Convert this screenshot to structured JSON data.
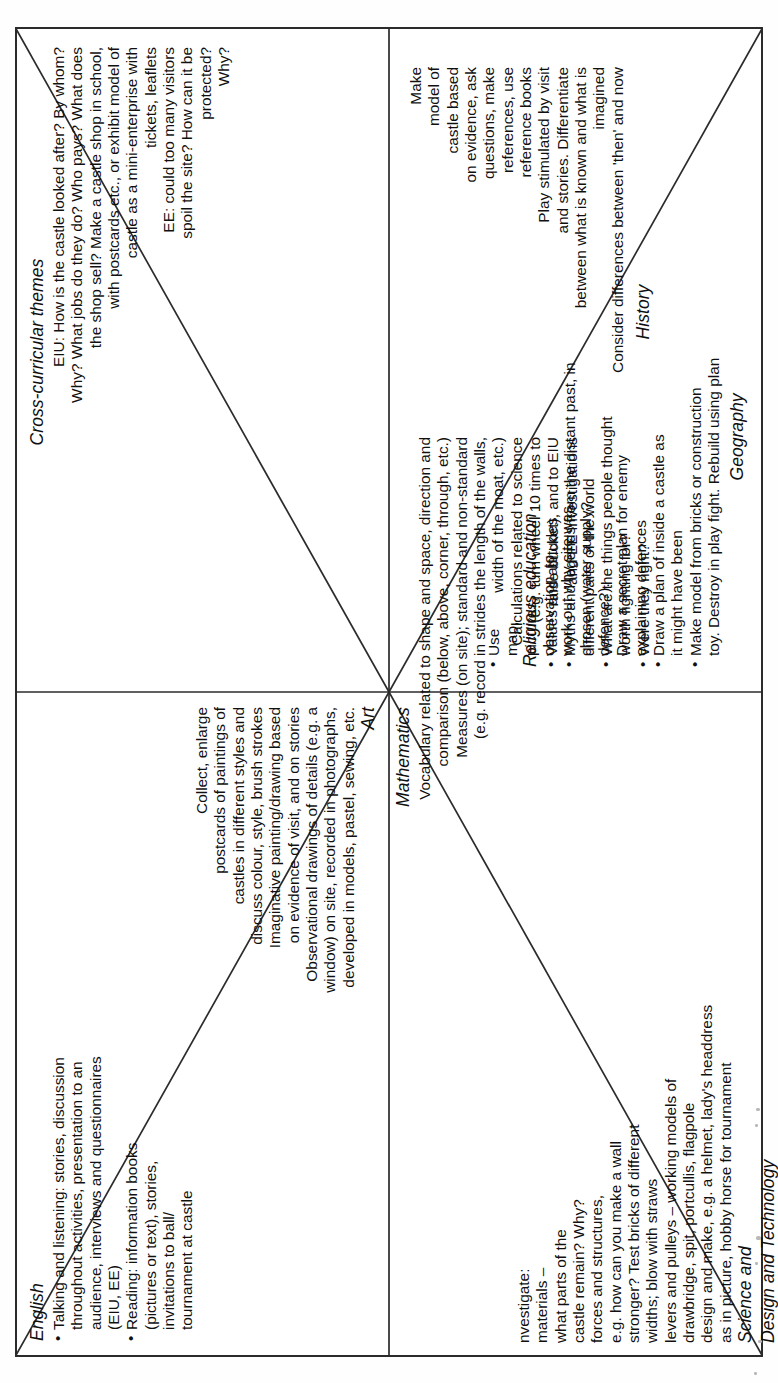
{
  "document": {
    "kind": "curriculum-planning-web",
    "topic_note": "Castles topic plan split into eight curriculum areas",
    "orientation": "rotated-90-counterclockwise",
    "ink_color": "#101010",
    "line_color": "#2b2b2b",
    "page_color": "#ffffff"
  },
  "cells": {
    "english": {
      "title": "English",
      "bullets": [
        "Talking and listening: stories, discussion\nthroughout activities, presentation to an\naudience, interviews and questionnaires\n(EIU, EE)",
        "Reading: information books\n(pictures or text), stories,\ninvitations to ball/\ntournament at castle"
      ]
    },
    "art": {
      "title": "Art",
      "bullets": [
        "Collect, enlarge\npostcards of paintings of\ncastles in different styles and\ndiscuss colour, style, brush strokes",
        "Imaginative painting/drawing based\non evidence of visit, and on stories",
        "Observational drawings of details (e.g. a\nwindow) on site, recorded in photographs,\ndeveloped in models, pastel, sewing, etc."
      ]
    },
    "cross_curricular": {
      "title": "Cross-curricular themes",
      "bullets": [
        "EIU:  How is the castle looked after?  By whom?\nWhy? What jobs do they do? Who pays? What does\nthe shop sell? Make a castle shop in school,\nwith postcards etc., or exhibit model of\ncastle as a mini-enterprise with\ntickets, leaflets",
        "EE: could too many visitors\nspoil the site? How can it be\nprotected?\nWhy?"
      ]
    },
    "geography": {
      "title": "Geography",
      "bullets": [
        "Use\nmap,\npictures,\nobservation, to\nwork out why site was\nchosen (water supply?\ndefence?).\nDraw a secret plan for enemy\nexplaining defences",
        "Draw a plan of inside a castle as\nit might have been",
        "Make model from bricks or construction\ntoy. Destroy in play fight. Rebuild using plan"
      ]
    },
    "mathematics": {
      "title": "Mathematics",
      "bullets": [
        "Vocabulary related to shape and space, direction and\ncomparison (below, above, corner, through, etc.)",
        "Measures (on site); standard and non-standard\n(e.g. record in strides the length of the walls,\nwidth of the moat, etc.)",
        "Calculations related to science\n(e.g. turn wheel 10 times to\nraise bucket), and to EIU\nand EE investigations"
      ]
    },
    "science_dt": {
      "title_line1": "Science and",
      "title_line2": "Design and Technology",
      "body": "nvestigate:\nmaterials –\nwhat parts of the\ncastle remain?  Why?\nforces and structures,\ne.g. how can you make a wall\nstronger? Test bricks of different\nwidths; blow with straws\nlevers and pulleys – working models of\ndrawbridge, spit, portcullis, flagpole\ndesign and make, e.g. a helmet, lady's headdress\nas in picture, hobby horse for tournament"
    },
    "religious_education": {
      "title": "Religious education",
      "bullets": [
        "Values and attitudes",
        "Myths and legends from the distant past, in\ndifferent parts of the world",
        "What are the things people thought\nworth fighting for?",
        "Were they right?"
      ]
    },
    "history": {
      "title": "History",
      "bullets": [
        "Make\nmodel of\ncastle based\non evidence, ask\nquestions, make\nreferences, use\nreference books",
        "Play stimulated by visit\nand stories. Differentiate\nbetween what is known and what is\nimagined",
        "Consider differences between 'then' and now"
      ]
    }
  }
}
